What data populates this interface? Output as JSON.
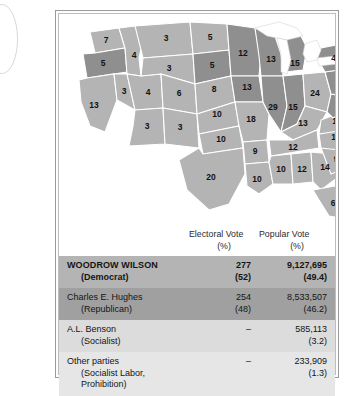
{
  "map": {
    "name": "united-states-electoral-map-1916",
    "legend_shades": {
      "wilson_democrat": "#b4b4b4",
      "hughes_republican": "#8f8f8f",
      "water": "#ffffff",
      "border": "#ffffff"
    },
    "states": [
      {
        "code": "WA",
        "votes": "7",
        "winner": "Wilson"
      },
      {
        "code": "OR",
        "votes": "5",
        "winner": "Hughes"
      },
      {
        "code": "CA",
        "votes": "13",
        "winner": "Wilson"
      },
      {
        "code": "ID",
        "votes": "4",
        "winner": "Wilson"
      },
      {
        "code": "NV",
        "votes": "3",
        "winner": "Wilson"
      },
      {
        "code": "MT",
        "votes": "3",
        "winner": "Wilson"
      },
      {
        "code": "UT",
        "votes": "4",
        "winner": "Wilson"
      },
      {
        "code": "AZ",
        "votes": "3",
        "winner": "Wilson"
      },
      {
        "code": "WY",
        "votes": "3",
        "winner": "Wilson"
      },
      {
        "code": "CO",
        "votes": "6",
        "winner": "Wilson"
      },
      {
        "code": "NM",
        "votes": "3",
        "winner": "Wilson"
      },
      {
        "code": "ND",
        "votes": "5",
        "winner": "Wilson"
      },
      {
        "code": "SD",
        "votes": "5",
        "winner": "Hughes"
      },
      {
        "code": "NE",
        "votes": "8",
        "winner": "Wilson"
      },
      {
        "code": "KS",
        "votes": "10",
        "winner": "Wilson"
      },
      {
        "code": "OK",
        "votes": "10",
        "winner": "Wilson"
      },
      {
        "code": "TX",
        "votes": "20",
        "winner": "Wilson"
      },
      {
        "code": "MN",
        "votes": "12",
        "winner": "Hughes"
      },
      {
        "code": "IA",
        "votes": "13",
        "winner": "Hughes"
      },
      {
        "code": "MO",
        "votes": "18",
        "winner": "Wilson"
      },
      {
        "code": "AR",
        "votes": "9",
        "winner": "Wilson"
      },
      {
        "code": "LA",
        "votes": "10",
        "winner": "Wilson"
      },
      {
        "code": "WI",
        "votes": "13",
        "winner": "Hughes"
      },
      {
        "code": "IL",
        "votes": "29",
        "winner": "Hughes"
      },
      {
        "code": "MI",
        "votes": "15",
        "winner": "Hughes"
      },
      {
        "code": "IN",
        "votes": "15",
        "winner": "Hughes"
      },
      {
        "code": "OH",
        "votes": "24",
        "winner": "Wilson"
      },
      {
        "code": "KY",
        "votes": "13",
        "winner": "Wilson"
      },
      {
        "code": "TN",
        "votes": "12",
        "winner": "Wilson"
      },
      {
        "code": "MS",
        "votes": "10",
        "winner": "Wilson"
      },
      {
        "code": "AL",
        "votes": "12",
        "winner": "Wilson"
      },
      {
        "code": "GA",
        "votes": "14",
        "winner": "Wilson"
      },
      {
        "code": "FL",
        "votes": "6",
        "winner": "Wilson"
      },
      {
        "code": "SC",
        "votes": "9",
        "winner": "Wilson"
      },
      {
        "code": "NC",
        "votes": "12",
        "winner": "Wilson"
      },
      {
        "code": "VA",
        "votes": "12",
        "winner": "Wilson"
      },
      {
        "code": "WV",
        "votes": "7",
        "winner": "Hughes"
      },
      {
        "code": "PA",
        "votes": "38",
        "winner": "Hughes"
      },
      {
        "code": "NY",
        "votes": "45",
        "winner": "Hughes"
      },
      {
        "code": "MD",
        "votes": "8",
        "winner": "Wilson"
      },
      {
        "code": "DE",
        "votes": "3",
        "winner": "Hughes"
      },
      {
        "code": "NJ",
        "votes": "14",
        "winner": "Hughes"
      },
      {
        "code": "CT",
        "votes": "7",
        "winner": "Hughes"
      },
      {
        "code": "RI",
        "votes": "5",
        "winner": "Hughes"
      },
      {
        "code": "MA",
        "votes": "18",
        "winner": "Hughes"
      },
      {
        "code": "VT",
        "votes": "4",
        "winner": "Hughes"
      },
      {
        "code": "NH",
        "votes": "4",
        "winner": "Hughes"
      },
      {
        "code": "ME",
        "votes": "6",
        "winner": "Hughes"
      }
    ]
  },
  "table": {
    "headers": {
      "candidate": "",
      "electoral_vote": "Electoral Vote",
      "electoral_vote_sub": "(%)",
      "popular_vote": "Popular Vote",
      "popular_vote_sub": "(%)"
    },
    "rows": [
      {
        "candidate": "WOODROW WILSON",
        "party": "(Democrat)",
        "electoral_vote": "277",
        "electoral_pct": "(52)",
        "popular_vote": "9,127,695",
        "popular_pct": "(49.4)",
        "shade": "#b4b4b4"
      },
      {
        "candidate": "Charles E. Hughes",
        "party": "(Republican)",
        "electoral_vote": "254",
        "electoral_pct": "(48)",
        "popular_vote": "8,533,507",
        "popular_pct": "(46.2)",
        "shade": "#a0a0a0"
      },
      {
        "candidate": "A.L. Benson",
        "party": "(Socialist)",
        "electoral_vote": "–",
        "electoral_pct": "",
        "popular_vote": "585,113",
        "popular_pct": "(3.2)",
        "shade": "#dcdcdc"
      },
      {
        "candidate": "Other parties",
        "party": "(Socialist Labor, Prohibition)",
        "electoral_vote": "–",
        "electoral_pct": "",
        "popular_vote": "233,909",
        "popular_pct": "(1.3)",
        "shade": "#e6e6e6"
      }
    ]
  }
}
